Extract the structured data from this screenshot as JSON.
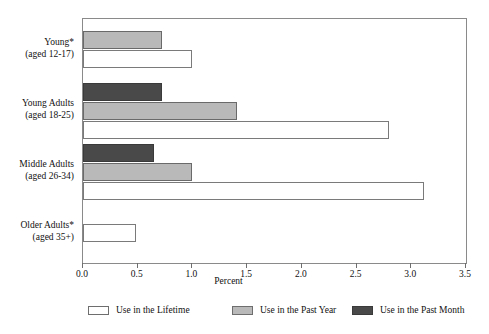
{
  "chart_data": {
    "type": "bar",
    "orientation": "horizontal",
    "title": "",
    "xlabel": "Percent",
    "ylabel": "",
    "xlim": [
      0.0,
      3.5
    ],
    "xticks": [
      "0.0",
      "0.5",
      "1.0",
      "1.5",
      "2.0",
      "2.5",
      "3.0",
      "3.5"
    ],
    "xtick_values": [
      0.0,
      0.5,
      1.0,
      1.5,
      2.0,
      2.5,
      3.0,
      3.5
    ],
    "grid": false,
    "legend_position": "bottom",
    "categories": [
      {
        "line1": "Young*",
        "line2": "(aged 12-17)"
      },
      {
        "line1": "Young Adults",
        "line2": "(aged 18-25)"
      },
      {
        "line1": "Middle Adults",
        "line2": "(aged 26-34)"
      },
      {
        "line1": "Older Adults*",
        "line2": "(aged 35+)"
      }
    ],
    "series": [
      {
        "name": "Use in the Lifetime",
        "color": "#ffffff",
        "values": [
          1.0,
          2.8,
          3.12,
          0.48
        ]
      },
      {
        "name": "Use in the Past Year",
        "color": "#b9b9b9",
        "values": [
          0.72,
          1.41,
          1.0,
          null
        ]
      },
      {
        "name": "Use in the Past Month",
        "color": "#494949",
        "values": [
          null,
          0.72,
          0.65,
          null
        ]
      }
    ]
  },
  "legend": {
    "items": [
      {
        "label": "Use in the Lifetime",
        "swatch": "lifetime"
      },
      {
        "label": "Use in the Past Year",
        "swatch": "pastyear"
      },
      {
        "label": "Use in the Past Month",
        "swatch": "pastmonth"
      }
    ]
  },
  "axis": {
    "x_title": "Percent"
  },
  "colors": {
    "lifetime": "#ffffff",
    "past_year": "#b9b9b9",
    "past_month": "#494949",
    "frame": "#8a8a8a",
    "text": "#111111"
  }
}
